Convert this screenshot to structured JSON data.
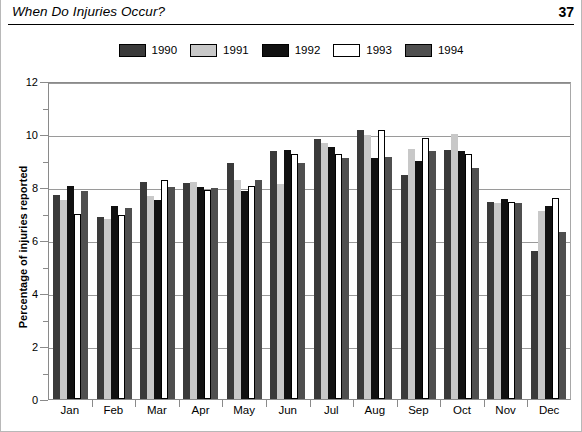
{
  "header": {
    "title": "When Do Injuries Occur?",
    "page_number": "37"
  },
  "chart_data": {
    "type": "bar",
    "title": "When Do Injuries Occur?",
    "xlabel": "",
    "ylabel": "Percentage of injuries reported",
    "ylim": [
      0,
      12
    ],
    "y_ticks": [
      "0",
      "2",
      "4",
      "6",
      "8",
      "10",
      "12"
    ],
    "y_minor_ticks": [
      1,
      3,
      5,
      7,
      9,
      11
    ],
    "grid": true,
    "legend_position": "top-center",
    "categories": [
      "Jan",
      "Feb",
      "Mar",
      "Apr",
      "May",
      "Jun",
      "Jul",
      "Aug",
      "Sep",
      "Oct",
      "Nov",
      "Dec"
    ],
    "series": [
      {
        "name": "1990",
        "color": "#3a3a3a",
        "values": [
          7.7,
          6.85,
          8.2,
          8.15,
          8.9,
          9.35,
          9.8,
          10.15,
          8.45,
          9.4,
          7.45,
          5.6
        ]
      },
      {
        "name": "1991",
        "color": "#c8c8c8",
        "values": [
          7.5,
          6.8,
          7.65,
          8.2,
          8.25,
          8.1,
          9.65,
          9.95,
          9.45,
          10.0,
          7.4,
          7.1
        ]
      },
      {
        "name": "1992",
        "color": "#111111",
        "values": [
          8.05,
          7.3,
          7.5,
          8.0,
          7.85,
          9.4,
          9.5,
          9.1,
          9.0,
          9.35,
          7.55,
          7.3
        ]
      },
      {
        "name": "1993",
        "color": "#ffffff",
        "values": [
          7.0,
          6.95,
          8.25,
          7.9,
          8.05,
          9.25,
          9.25,
          10.15,
          9.85,
          9.25,
          7.45,
          7.6
        ]
      },
      {
        "name": "1994",
        "color": "#4f4f4f",
        "values": [
          7.85,
          7.2,
          8.0,
          7.95,
          8.25,
          8.9,
          9.1,
          9.15,
          9.35,
          8.7,
          7.4,
          6.3
        ]
      }
    ]
  }
}
